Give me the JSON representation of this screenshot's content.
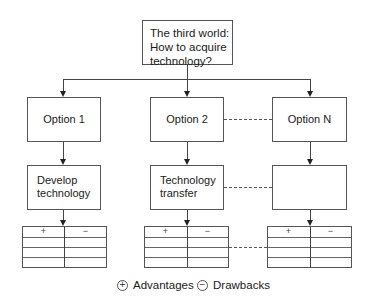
{
  "diagram": {
    "root": {
      "lines": [
        "The third world:",
        "How to acquire",
        "technology?"
      ]
    },
    "options": [
      {
        "label": "Option 1",
        "approach": [
          "Develop",
          "technology"
        ]
      },
      {
        "label": "Option 2",
        "approach": [
          "Technology",
          "transfer"
        ]
      },
      {
        "label": "Option N",
        "approach": []
      }
    ],
    "table_headers": {
      "plus": "+",
      "minus": "−"
    },
    "legend": [
      {
        "symbol": "+",
        "label": "Advantages"
      },
      {
        "symbol": "−",
        "label": "Drawbacks"
      }
    ]
  }
}
